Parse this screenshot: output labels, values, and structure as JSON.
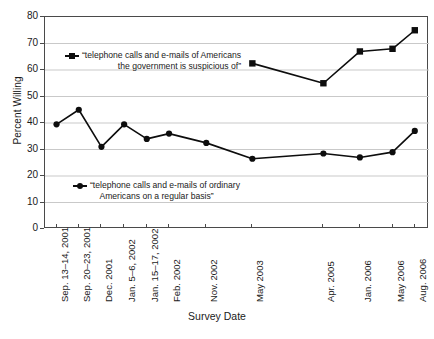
{
  "chart_data": {
    "type": "line",
    "title": "",
    "xlabel": "Survey Date",
    "ylabel": "Percent Willing",
    "ylim": [
      0,
      80
    ],
    "ytick_step": 10,
    "yticks": [
      "0",
      "10",
      "20",
      "30",
      "40",
      "50",
      "60",
      "70",
      "80"
    ],
    "grid": "horizontal",
    "legend_position": "inside-plot",
    "categories": [
      "Sep. 13–14, 2001",
      "Sep. 20–23, 2001",
      "Dec. 2001",
      "Jan. 5–6, 2002",
      "Jan. 15–17, 2002",
      "Feb. 2002",
      "Nov. 2002",
      "May 2003",
      "Apr. 2005",
      "Jan. 2006",
      "May 2006",
      "Aug. 2006"
    ],
    "series": [
      {
        "name": "“telephone calls and e-mails of Americans the government is suspicious of”",
        "name_line1": "“telephone calls and e-mails of Americans",
        "name_line2": "the government is suspicious of”",
        "marker": "square",
        "color": "#0d0d0d",
        "values": [
          null,
          null,
          null,
          null,
          null,
          null,
          null,
          62.5,
          55,
          67,
          68,
          75
        ]
      },
      {
        "name": "“telephone calls and e-mails of ordinary Americans on a regular basis”",
        "name_line1": "“telephone calls and e-mails of ordinary",
        "name_line2": "Americans on a regular basis”",
        "marker": "circle",
        "color": "#0d0d0d",
        "values": [
          39.5,
          45,
          31,
          39.5,
          34,
          36,
          32.5,
          26.5,
          28.5,
          27,
          29,
          37
        ]
      }
    ]
  }
}
